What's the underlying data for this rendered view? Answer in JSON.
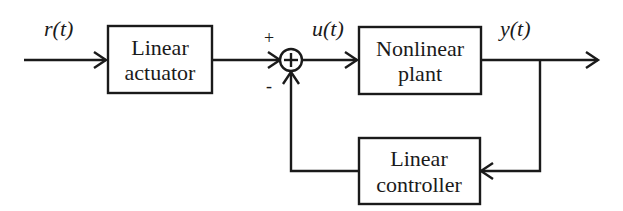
{
  "diagram": {
    "type": "block-diagram",
    "blocks": [
      {
        "id": "actuator",
        "line1": "Linear",
        "line2": "actuator"
      },
      {
        "id": "plant",
        "line1": "Nonlinear",
        "line2": "plant"
      },
      {
        "id": "controller",
        "line1": "Linear",
        "line2": "controller"
      }
    ],
    "signals": {
      "input": "r(t)",
      "control": "u(t)",
      "output": "y(t)"
    },
    "summing_junction": {
      "symbol": "+",
      "top_sign": "+",
      "bottom_sign": "-"
    },
    "connections": [
      {
        "from": "input",
        "to": "actuator",
        "label": "r(t)"
      },
      {
        "from": "actuator",
        "to": "summing_junction",
        "sign": "+"
      },
      {
        "from": "summing_junction",
        "to": "plant",
        "label": "u(t)"
      },
      {
        "from": "plant",
        "to": "output",
        "label": "y(t)"
      },
      {
        "from": "output",
        "to": "controller",
        "type": "feedback"
      },
      {
        "from": "controller",
        "to": "summing_junction",
        "sign": "-"
      }
    ]
  }
}
